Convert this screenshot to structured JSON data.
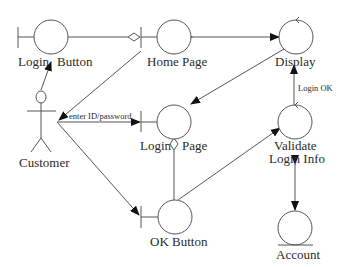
{
  "diagram": {
    "type": "UML robustness diagram",
    "colors": {
      "stroke": "#555555",
      "text": "#2a2a2a",
      "arrow": "#111111",
      "background": "#ffffff"
    },
    "actor": {
      "label": "Customer"
    },
    "boundaries": {
      "login_button": {
        "label_left": "Login",
        "label_right": "Button"
      },
      "home_page": {
        "label": "Home Page"
      },
      "login_page": {
        "label_left": "Login",
        "label_right": "Page"
      },
      "ok_button": {
        "label": "OK Button"
      }
    },
    "controls": {
      "display": {
        "label": "Display"
      },
      "validate": {
        "label_line1": "Validate",
        "label_line2": "Login Info"
      }
    },
    "entities": {
      "account": {
        "label": "Account"
      }
    },
    "edge_labels": {
      "enter_credentials": "enter ID/password",
      "login_ok": "Login OK"
    }
  }
}
